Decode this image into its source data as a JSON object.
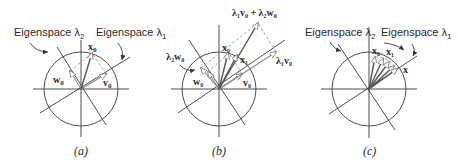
{
  "figure": {
    "panels": [
      {
        "id": "a",
        "caption": "(a)",
        "eigenspace_labels": [
          "Eigenspace λ",
          "Eigenspace λ"
        ],
        "eigenspace_subs": [
          "2",
          "1"
        ],
        "vectors": {
          "x0": "x",
          "v0": "v",
          "w0": "w"
        },
        "subs": {
          "x0": "0",
          "v0": "0",
          "w0": "0"
        }
      },
      {
        "id": "b",
        "caption": "(b)",
        "vectors": {
          "sum": "λ",
          "x0": "x",
          "x1": "x",
          "v0": "v",
          "w0": "w",
          "l1v0": "λ",
          "l2w0": "λ"
        },
        "sum_label": "λ₁v₀ + λ₂w₀",
        "l1v0_label": "λ₁v₀",
        "l2w0_label": "λ₂w₀",
        "x0_label": "x₀",
        "x1_label": "x₁",
        "v0_label": "v₀",
        "w0_label": "w₀"
      },
      {
        "id": "c",
        "caption": "(c)",
        "eigenspace_labels": [
          "Eigenspace λ",
          "Eigenspace λ"
        ],
        "eigenspace_subs": [
          "2",
          "1"
        ],
        "x0_label": "x₀",
        "x1_label": "x₁",
        "x_label": "x"
      }
    ]
  }
}
